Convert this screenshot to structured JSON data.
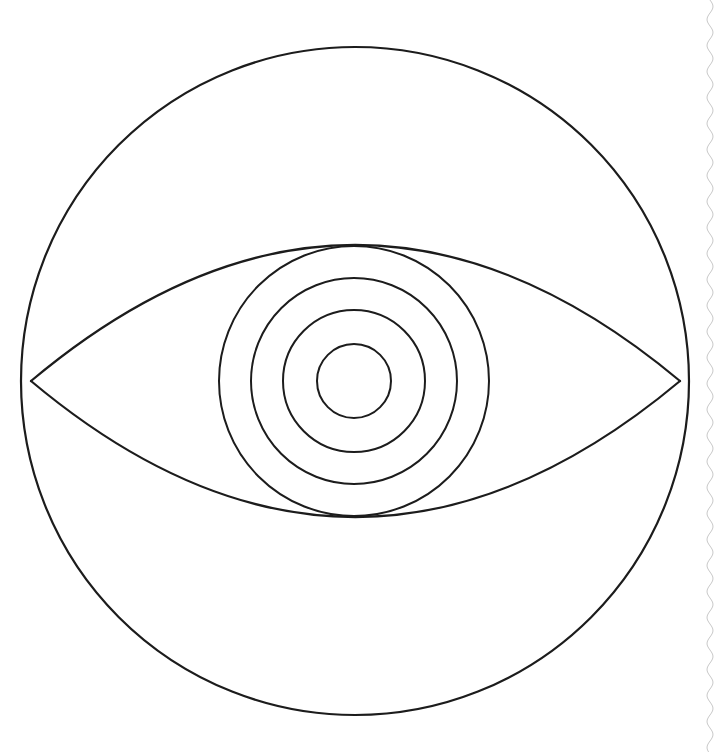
{
  "document": {
    "title": "Eye Diagram",
    "caption": "Geometric line drawing of an eye: outer circle, lens-shaped eyelid aperture, and four concentric circles forming iris and pupil.",
    "background_color": "#ffffff",
    "ink_color": "#1c1c1c",
    "scan_artifact_color": "#c9c9c9",
    "canvas": {
      "width": 720,
      "height": 752
    }
  },
  "chart_data": {
    "type": "diagram",
    "style": "monochrome line art, no fill",
    "stroke_color": "#1c1c1c",
    "background": "#ffffff",
    "shapes": [
      {
        "name": "outer-circle",
        "role": "eyeball outline",
        "kind": "circle",
        "cx": 355,
        "cy": 381,
        "r": 334,
        "stroke_width": 2.2
      },
      {
        "name": "upper-eyelid-arc",
        "role": "upper lid of lens aperture",
        "kind": "arc",
        "from": [
          31,
          381
        ],
        "to": [
          680,
          381
        ],
        "apex": [
          355,
          245
        ],
        "stroke_width": 2.2
      },
      {
        "name": "lower-eyelid-arc",
        "role": "lower lid of lens aperture",
        "kind": "arc",
        "from": [
          31,
          381
        ],
        "to": [
          680,
          381
        ],
        "apex": [
          355,
          517
        ],
        "stroke_width": 2.2
      },
      {
        "name": "iris-outer-circle",
        "role": "iris outer ring",
        "kind": "circle",
        "cx": 354,
        "cy": 381,
        "r": 135,
        "stroke_width": 2.0
      },
      {
        "name": "iris-middle-circle",
        "role": "iris middle ring",
        "kind": "circle",
        "cx": 354,
        "cy": 381,
        "r": 103,
        "stroke_width": 2.0
      },
      {
        "name": "iris-inner-circle",
        "role": "iris inner ring",
        "kind": "circle",
        "cx": 354,
        "cy": 381,
        "r": 71,
        "stroke_width": 2.0
      },
      {
        "name": "pupil-circle",
        "role": "pupil",
        "kind": "circle",
        "cx": 354,
        "cy": 381,
        "r": 37,
        "stroke_width": 2.0
      },
      {
        "name": "page-edge-artifact",
        "role": "faint wavy scan edge of paper",
        "kind": "wavy-line",
        "x": 710,
        "y_from": 0,
        "y_to": 752,
        "amplitude": 3,
        "wavelength": 26,
        "stroke_width": 1
      }
    ],
    "counts": {
      "circles": 5,
      "arcs": 2,
      "concentric_iris_rings": 4
    },
    "geometry_notes": {
      "lens_half_height": 136,
      "lens_half_width": 324,
      "lens_vertices": [
        [
          31,
          381
        ],
        [
          680,
          381
        ]
      ],
      "common_center": [
        354,
        381
      ]
    }
  }
}
